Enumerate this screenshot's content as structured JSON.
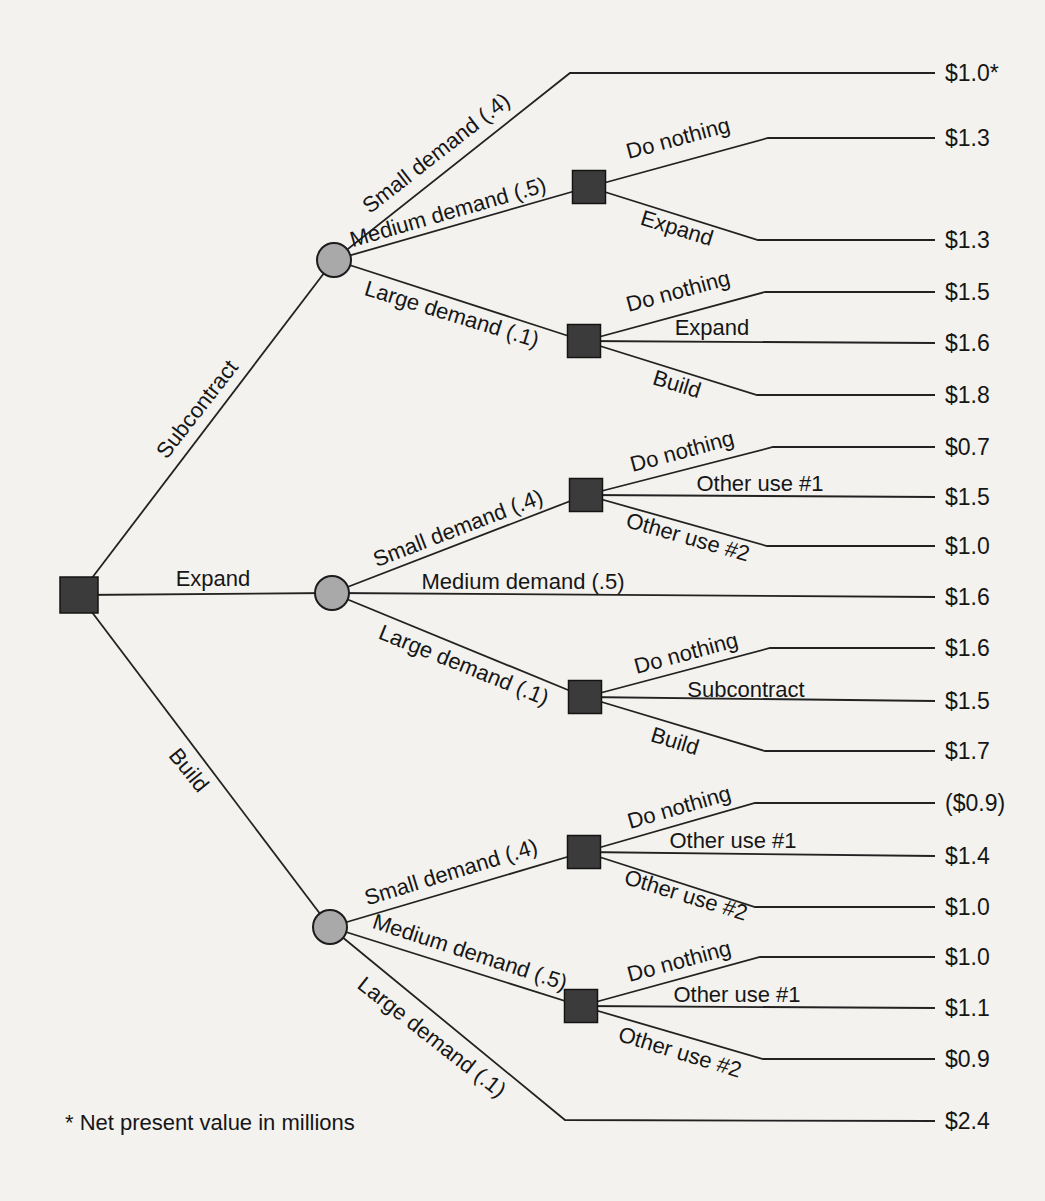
{
  "colors": {
    "background": "#f3f2ee",
    "line": "#222222",
    "chance_node_fill": "#a9a9a9",
    "decision_node_fill": "#3b3b3b",
    "text": "#161616"
  },
  "tree": {
    "root_node_type": "decision",
    "alternatives": [
      {
        "label": "Subcontract",
        "node_type": "chance",
        "outcomes": [
          {
            "label": "Small demand (.4)",
            "value": "$1.0*"
          },
          {
            "label": "Medium demand (.5)",
            "node_type": "decision",
            "decisions": [
              {
                "label": "Do nothing",
                "value": "$1.3"
              },
              {
                "label": "Expand",
                "value": "$1.3"
              }
            ]
          },
          {
            "label": "Large demand (.1)",
            "node_type": "decision",
            "decisions": [
              {
                "label": "Do nothing",
                "value": "$1.5"
              },
              {
                "label": "Expand",
                "value": "$1.6"
              },
              {
                "label": "Build",
                "value": "$1.8"
              }
            ]
          }
        ]
      },
      {
        "label": "Expand",
        "node_type": "chance",
        "outcomes": [
          {
            "label": "Small demand (.4)",
            "node_type": "decision",
            "decisions": [
              {
                "label": "Do nothing",
                "value": "$0.7"
              },
              {
                "label": "Other use #1",
                "value": "$1.5"
              },
              {
                "label": "Other use #2",
                "value": "$1.0"
              }
            ]
          },
          {
            "label": "Medium demand (.5)",
            "value": "$1.6"
          },
          {
            "label": "Large demand (.1)",
            "node_type": "decision",
            "decisions": [
              {
                "label": "Do nothing",
                "value": "$1.6"
              },
              {
                "label": "Subcontract",
                "value": "$1.5"
              },
              {
                "label": "Build",
                "value": "$1.7"
              }
            ]
          }
        ]
      },
      {
        "label": "Build",
        "node_type": "chance",
        "outcomes": [
          {
            "label": "Small demand (.4)",
            "node_type": "decision",
            "decisions": [
              {
                "label": "Do nothing",
                "value": "($0.9)"
              },
              {
                "label": "Other use #1",
                "value": "$1.4"
              },
              {
                "label": "Other use #2",
                "value": "$1.0"
              }
            ]
          },
          {
            "label": "Medium demand (.5)",
            "node_type": "decision",
            "decisions": [
              {
                "label": "Do nothing",
                "value": "$1.0"
              },
              {
                "label": "Other use #1",
                "value": "$1.1"
              },
              {
                "label": "Other use #2",
                "value": "$0.9"
              }
            ]
          },
          {
            "label": "Large demand (.1)",
            "value": "$2.4"
          }
        ]
      }
    ],
    "footnote": "* Net present value in millions"
  }
}
